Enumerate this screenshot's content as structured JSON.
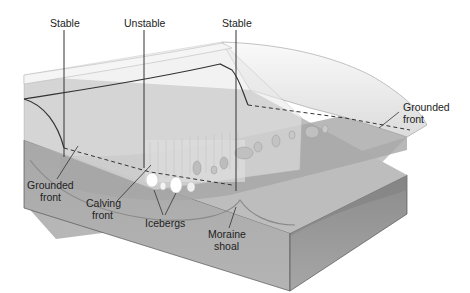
{
  "diagram": {
    "labels": {
      "stable_left": "Stable",
      "unstable": "Unstable",
      "stable_right": "Stable",
      "grounded_front_right_1": "Grounded",
      "grounded_front_right_2": "front",
      "grounded_front_left_1": "Grounded",
      "grounded_front_left_2": "front",
      "calving_front_1": "Calving",
      "calving_front_2": "front",
      "icebergs": "Icebergs",
      "moraine_shoal_1": "Moraine",
      "moraine_shoal_2": "shoal"
    },
    "colors": {
      "ice": "#f2f2f2",
      "ice_shadow": "#d9d9d9",
      "water_surface": "#b8b8b8",
      "block_top": "#a9a9a9",
      "block_front": "#a0a0a0",
      "block_side": "#8f8f8f",
      "line": "#333333"
    }
  }
}
